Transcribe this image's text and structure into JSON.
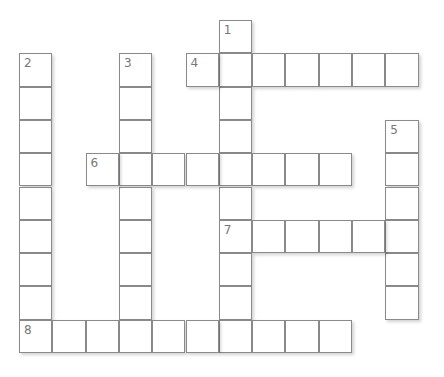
{
  "puzzle": {
    "cell_size": 33.3,
    "origin_x": 19,
    "origin_y": 20,
    "entries": [
      {
        "number": "1",
        "direction": "down",
        "row": 0,
        "col": 6,
        "length": 10
      },
      {
        "number": "2",
        "direction": "down",
        "row": 1,
        "col": 0,
        "length": 9
      },
      {
        "number": "3",
        "direction": "down",
        "row": 1,
        "col": 3,
        "length": 8
      },
      {
        "number": "4",
        "direction": "across",
        "row": 1,
        "col": 5,
        "length": 7
      },
      {
        "number": "5",
        "direction": "down",
        "row": 3,
        "col": 11,
        "length": 6
      },
      {
        "number": "6",
        "direction": "across",
        "row": 4,
        "col": 2,
        "length": 8
      },
      {
        "number": "7",
        "direction": "across",
        "row": 6,
        "col": 6,
        "length": 6
      },
      {
        "number": "8",
        "direction": "across",
        "row": 9,
        "col": 0,
        "length": 10
      }
    ]
  }
}
